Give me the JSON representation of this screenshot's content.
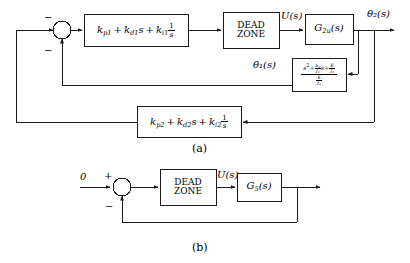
{
  "figure": {
    "captions": {
      "a": "(a)",
      "b": "(b)"
    }
  },
  "diagram_a": {
    "summing_junction": {
      "name": "summing-junction-a",
      "sign_top": "−",
      "sign_bottom": "−"
    },
    "blocks": {
      "pid_inner": {
        "kp": "k",
        "kp_sub": "p1",
        "kd": "k",
        "kd_sub": "d1",
        "ki": "k",
        "ki_sub": "i1",
        "s": "s",
        "one": "1",
        "plus": "+",
        "text": "k_p1 + k_d1 s + k_i1 (1/s)"
      },
      "dead_zone": {
        "line1": "DEAD",
        "line2": "ZONE"
      },
      "plant": {
        "g": "G",
        "g_sub": "2u",
        "arg": "(s)",
        "text": "G_2u(s)"
      },
      "theta1_tf": {
        "num": "s² + (b₂/J₂)s + K/J₂",
        "den": "K/J₂",
        "num_parts": {
          "s2": "s",
          "exp2": "2",
          "plus1": "+",
          "b": "b",
          "b_sub": "2",
          "J": "J",
          "J_sub": "2",
          "s": "s",
          "plus2": "+",
          "K": "K"
        },
        "den_parts": {
          "K": "K",
          "J": "J",
          "J_sub": "2"
        }
      },
      "pid_outer": {
        "kp": "k",
        "kp_sub": "p2",
        "kd": "k",
        "kd_sub": "d2",
        "ki": "k",
        "ki_sub": "i2",
        "s": "s",
        "one": "1",
        "plus": "+",
        "text": "k_p2 + k_d2 s + k_i2 (1/s)"
      }
    },
    "signals": {
      "u": "U(s)",
      "theta1": "θ₁(s)",
      "theta2": "θ₂(s)"
    }
  },
  "diagram_b": {
    "input": "0",
    "summing_junction": {
      "name": "summing-junction-b",
      "sign_top": "+",
      "sign_bottom": "−"
    },
    "blocks": {
      "dead_zone": {
        "line1": "DEAD",
        "line2": "ZONE"
      },
      "plant": {
        "g": "G",
        "g_sub": "5",
        "arg": "(s)",
        "text": "G_5(s)"
      }
    },
    "signals": {
      "u": "U(s)"
    }
  },
  "style": {
    "line_color": "#1a1a1a",
    "block_fill": "#ffffff",
    "text_color": "#000000"
  }
}
